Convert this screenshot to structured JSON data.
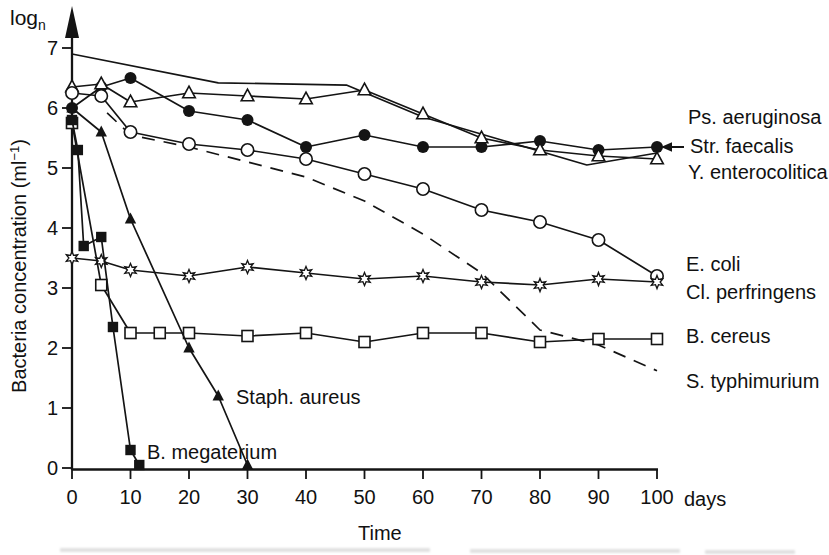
{
  "figure": {
    "y_symbol": {
      "base": "log",
      "sub": "n"
    },
    "y_title": {
      "pre": "Bacteria concentration (ml",
      "sup": "−1",
      "post": ")"
    },
    "x_title": "Time",
    "x_unit": "days",
    "y_ticks": [
      0,
      1,
      2,
      3,
      4,
      5,
      6,
      7
    ],
    "x_ticks": [
      0,
      10,
      20,
      30,
      40,
      50,
      60,
      70,
      80,
      90,
      100
    ]
  },
  "labels": {
    "ps_aeruginosa": "Ps. aeruginosa",
    "str_faecalis": "Str. faecalis",
    "y_enterocolitica": "Y. enterocolitica",
    "e_coli": "E. coli",
    "cl_perfringens": "Cl. perfringens",
    "b_cereus": "B. cereus",
    "s_typhimurium": "S. typhimurium",
    "staph_aureus": "Staph. aureus",
    "b_megaterium": "B. megaterium"
  },
  "chart_data": {
    "type": "line",
    "title": "",
    "xlabel": "Time (days)",
    "ylabel": "Bacteria concentration (ml-1), log n",
    "xlim": [
      0,
      100
    ],
    "ylim": [
      0,
      7
    ],
    "grid": false,
    "legend_position": "right-margin-labels",
    "series": [
      {
        "name": "Str. faecalis",
        "key": "str_faecalis",
        "marker": "none",
        "line": "solid",
        "points": [
          [
            0,
            6.9
          ],
          [
            25,
            6.42
          ],
          [
            47,
            6.38
          ],
          [
            60,
            5.85
          ],
          [
            74,
            5.45
          ],
          [
            88,
            5.05
          ],
          [
            100,
            5.25
          ]
        ]
      },
      {
        "name": "S. typhimurium",
        "key": "s_typhimurium",
        "marker": "none",
        "line": "dashed",
        "points": [
          [
            6,
            5.92
          ],
          [
            10,
            5.55
          ],
          [
            20,
            5.35
          ],
          [
            30,
            5.1
          ],
          [
            40,
            4.85
          ],
          [
            50,
            4.45
          ],
          [
            60,
            3.9
          ],
          [
            70,
            3.25
          ],
          [
            80,
            2.3
          ],
          [
            90,
            2.05
          ],
          [
            100,
            1.62
          ]
        ]
      },
      {
        "name": "Ps. aeruginosa",
        "key": "ps_aeruginosa",
        "marker": "filled-circle",
        "line": "solid",
        "points": [
          [
            0,
            6.0
          ],
          [
            5,
            6.35
          ],
          [
            10,
            6.5
          ],
          [
            20,
            5.95
          ],
          [
            30,
            5.8
          ],
          [
            40,
            5.35
          ],
          [
            50,
            5.55
          ],
          [
            60,
            5.35
          ],
          [
            70,
            5.35
          ],
          [
            80,
            5.45
          ],
          [
            90,
            5.3
          ],
          [
            100,
            5.35
          ]
        ]
      },
      {
        "name": "Y. enterocolitica",
        "key": "y_enterocolitica",
        "marker": "open-triangle",
        "line": "solid",
        "points": [
          [
            0,
            6.35
          ],
          [
            5,
            6.4
          ],
          [
            10,
            6.1
          ],
          [
            20,
            6.25
          ],
          [
            30,
            6.2
          ],
          [
            40,
            6.15
          ],
          [
            50,
            6.3
          ],
          [
            60,
            5.9
          ],
          [
            70,
            5.5
          ],
          [
            80,
            5.3
          ],
          [
            90,
            5.2
          ],
          [
            100,
            5.15
          ]
        ]
      },
      {
        "name": "E. coli",
        "key": "e_coli",
        "marker": "open-circle",
        "line": "solid",
        "points": [
          [
            0,
            6.25
          ],
          [
            5,
            6.2
          ],
          [
            10,
            5.6
          ],
          [
            20,
            5.4
          ],
          [
            30,
            5.3
          ],
          [
            40,
            5.15
          ],
          [
            50,
            4.9
          ],
          [
            60,
            4.65
          ],
          [
            70,
            4.3
          ],
          [
            80,
            4.1
          ],
          [
            90,
            3.8
          ],
          [
            100,
            3.2
          ]
        ]
      },
      {
        "name": "Cl. perfringens",
        "key": "cl_perfringens",
        "marker": "open-star",
        "line": "solid",
        "points": [
          [
            0,
            3.5
          ],
          [
            5,
            3.45
          ],
          [
            10,
            3.3
          ],
          [
            20,
            3.2
          ],
          [
            30,
            3.35
          ],
          [
            40,
            3.25
          ],
          [
            50,
            3.15
          ],
          [
            60,
            3.2
          ],
          [
            70,
            3.1
          ],
          [
            80,
            3.05
          ],
          [
            90,
            3.15
          ],
          [
            100,
            3.1
          ]
        ]
      },
      {
        "name": "B. cereus",
        "key": "b_cereus",
        "marker": "open-square",
        "line": "solid",
        "points": [
          [
            0,
            5.75
          ],
          [
            5,
            3.05
          ],
          [
            10,
            2.25
          ],
          [
            15,
            2.25
          ],
          [
            20,
            2.25
          ],
          [
            30,
            2.2
          ],
          [
            40,
            2.25
          ],
          [
            50,
            2.1
          ],
          [
            60,
            2.25
          ],
          [
            70,
            2.25
          ],
          [
            80,
            2.1
          ],
          [
            90,
            2.15
          ],
          [
            100,
            2.15
          ]
        ]
      },
      {
        "name": "Staph. aureus",
        "key": "staph_aureus",
        "marker": "filled-triangle",
        "line": "solid",
        "points": [
          [
            0,
            6.0
          ],
          [
            5,
            5.6
          ],
          [
            10,
            4.15
          ],
          [
            20,
            2.0
          ],
          [
            25,
            1.2
          ],
          [
            30,
            0.05
          ]
        ]
      },
      {
        "name": "B. megaterium",
        "key": "b_megaterium",
        "marker": "filled-square",
        "line": "solid",
        "points": [
          [
            0,
            5.8
          ],
          [
            1,
            5.3
          ],
          [
            2,
            3.7
          ],
          [
            5,
            3.85
          ],
          [
            7,
            2.35
          ],
          [
            10,
            0.3
          ],
          [
            11.5,
            0.05
          ]
        ]
      }
    ],
    "annotations": [
      {
        "type": "arrow-left",
        "target_series": "Str. faecalis",
        "at_day": 100
      }
    ]
  }
}
